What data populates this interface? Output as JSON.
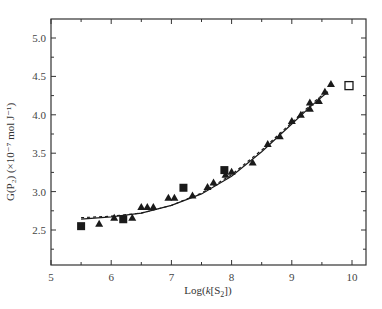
{
  "chart_data": {
    "type": "scatter",
    "title": "",
    "xlabel": "Log(k[S2])",
    "ylabel": "G(P2) (×10^-7 mol J^-1)",
    "xlim": [
      5,
      10.25
    ],
    "ylim": [
      2.1,
      5.25
    ],
    "x_ticks": [
      5,
      6,
      7,
      8,
      9,
      10
    ],
    "y_ticks": [
      2.5,
      3.0,
      3.5,
      4.0,
      4.5,
      5.0
    ],
    "grid": false,
    "legend": null,
    "series": [
      {
        "name": "triangles",
        "marker": "filled-triangle",
        "points": [
          [
            5.8,
            2.58
          ],
          [
            6.05,
            2.66
          ],
          [
            6.35,
            2.66
          ],
          [
            6.5,
            2.8
          ],
          [
            6.6,
            2.8
          ],
          [
            6.7,
            2.8
          ],
          [
            6.95,
            2.92
          ],
          [
            7.05,
            2.92
          ],
          [
            7.35,
            2.95
          ],
          [
            7.6,
            3.06
          ],
          [
            7.7,
            3.12
          ],
          [
            7.9,
            3.22
          ],
          [
            8.0,
            3.26
          ],
          [
            8.35,
            3.38
          ],
          [
            8.6,
            3.62
          ],
          [
            8.8,
            3.72
          ],
          [
            9.0,
            3.92
          ],
          [
            9.15,
            4.0
          ],
          [
            9.3,
            4.08
          ],
          [
            9.3,
            4.16
          ],
          [
            9.45,
            4.18
          ],
          [
            9.55,
            4.3
          ],
          [
            9.65,
            4.4
          ]
        ]
      },
      {
        "name": "filled squares",
        "marker": "filled-square",
        "points": [
          [
            5.5,
            2.55
          ],
          [
            6.2,
            2.64
          ],
          [
            7.2,
            3.05
          ],
          [
            7.88,
            3.28
          ]
        ]
      },
      {
        "name": "open square",
        "marker": "open-square",
        "points": [
          [
            9.95,
            4.38
          ]
        ]
      },
      {
        "name": "fit curve",
        "marker": "line",
        "points": [
          [
            5.5,
            2.64
          ],
          [
            6.0,
            2.67
          ],
          [
            6.5,
            2.72
          ],
          [
            7.0,
            2.82
          ],
          [
            7.5,
            2.97
          ],
          [
            8.0,
            3.2
          ],
          [
            8.5,
            3.52
          ],
          [
            9.0,
            3.88
          ],
          [
            9.3,
            4.1
          ],
          [
            9.6,
            4.3
          ]
        ]
      },
      {
        "name": "dashed curve",
        "marker": "dashed-line",
        "points": [
          [
            5.5,
            2.66
          ],
          [
            6.0,
            2.68
          ],
          [
            6.5,
            2.72
          ],
          [
            7.0,
            2.82
          ],
          [
            7.5,
            2.98
          ],
          [
            8.0,
            3.22
          ],
          [
            8.5,
            3.54
          ],
          [
            9.0,
            3.9
          ],
          [
            9.3,
            4.12
          ],
          [
            9.6,
            4.32
          ]
        ]
      }
    ]
  },
  "axes": {
    "x_title_prefix": "Log(",
    "x_title_k": "k",
    "x_title_mid": "[S",
    "x_title_sub": "2",
    "x_title_suffix": "])",
    "y_title": "G(P₂) (×10⁻⁷ mol J⁻¹)"
  },
  "colors": {
    "ink": "#1a1a1a",
    "frame": "#333333",
    "label": "#444444"
  }
}
